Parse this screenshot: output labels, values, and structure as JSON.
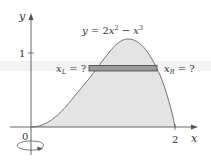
{
  "figure": {
    "curve_label": "y = 2x² − x³",
    "curve_label_parts": {
      "y": "y",
      "eq": " = 2",
      "x1": "x",
      "exp1": "2",
      "minus": " − ",
      "x2": "x",
      "exp2": "3"
    },
    "axes": {
      "x_label": "x",
      "y_label": "y",
      "origin_label": "0",
      "x_tick_label": "2",
      "y_tick_label": "1"
    },
    "strip": {
      "left_label_var": "x",
      "left_label_sub": "L",
      "left_label_rest": " = ?",
      "right_label_var": "x",
      "right_label_sub": "R",
      "right_label_rest": " = ?"
    },
    "rotation_icon": "rotation-arrow-icon",
    "colors": {
      "region_fill": "#e4e4e4",
      "strip_fill": "#9a9a9a",
      "curve": "#666666",
      "axes": "#555555",
      "text": "#333333"
    }
  }
}
